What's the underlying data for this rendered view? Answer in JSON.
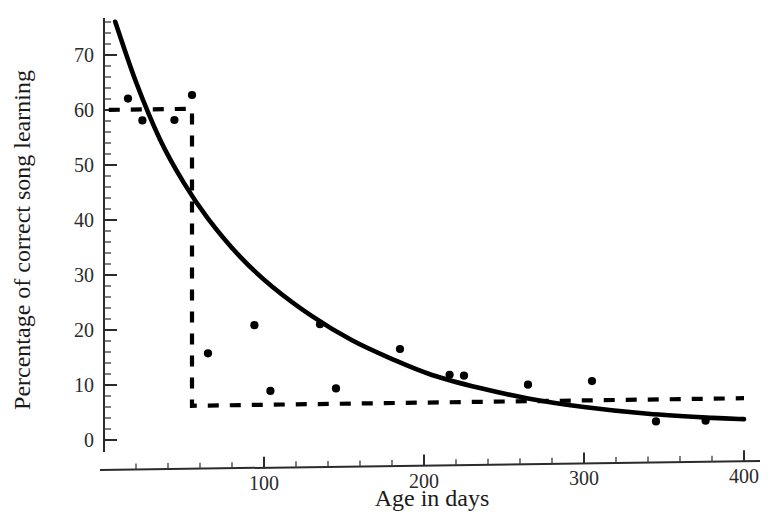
{
  "chart_data": {
    "type": "scatter",
    "title": "",
    "subtitle": "",
    "xlabel": "Age in days",
    "ylabel": "Percentage of correct song learning",
    "xlim": [
      0,
      405
    ],
    "ylim": [
      0,
      77
    ],
    "grid": false,
    "legend": "none",
    "x_ticks": [
      100,
      200,
      300,
      400
    ],
    "x_tick_labels": [
      "100",
      "200",
      "300",
      "400"
    ],
    "x_minor_tick_step": 20,
    "y_ticks": [
      0,
      10,
      20,
      30,
      40,
      50,
      60,
      70
    ],
    "y_tick_labels": [
      "0",
      "10",
      "20",
      "30",
      "40",
      "50",
      "60",
      "70"
    ],
    "y_minor_tick_step": 2,
    "series": [
      {
        "name": "Observed song learning",
        "type": "scatter",
        "marker": "filled-circle",
        "color": "#000000",
        "points": [
          {
            "x": 15,
            "y": 62.0
          },
          {
            "x": 24,
            "y": 58.0
          },
          {
            "x": 44,
            "y": 58.0
          },
          {
            "x": 55,
            "y": 62.5
          },
          {
            "x": 65,
            "y": 15.5
          },
          {
            "x": 94,
            "y": 20.5
          },
          {
            "x": 104,
            "y": 8.5
          },
          {
            "x": 135,
            "y": 20.5
          },
          {
            "x": 145,
            "y": 8.8
          },
          {
            "x": 185,
            "y": 15.8
          },
          {
            "x": 216,
            "y": 11.0
          },
          {
            "x": 225,
            "y": 10.8
          },
          {
            "x": 265,
            "y": 9.0
          },
          {
            "x": 305,
            "y": 9.5
          },
          {
            "x": 345,
            "y": 2.0
          },
          {
            "x": 376,
            "y": 2.0
          }
        ]
      },
      {
        "name": "Exponential decay fit",
        "type": "line",
        "style": "solid",
        "color": "#000000",
        "points": [
          {
            "x": 7,
            "y": 76.0
          },
          {
            "x": 20,
            "y": 65.0
          },
          {
            "x": 35,
            "y": 54.5
          },
          {
            "x": 50,
            "y": 46.5
          },
          {
            "x": 65,
            "y": 40.0
          },
          {
            "x": 85,
            "y": 33.0
          },
          {
            "x": 105,
            "y": 27.5
          },
          {
            "x": 130,
            "y": 22.0
          },
          {
            "x": 155,
            "y": 17.5
          },
          {
            "x": 180,
            "y": 14.0
          },
          {
            "x": 205,
            "y": 11.0
          },
          {
            "x": 235,
            "y": 8.5
          },
          {
            "x": 265,
            "y": 6.5
          },
          {
            "x": 300,
            "y": 4.8
          },
          {
            "x": 340,
            "y": 3.4
          },
          {
            "x": 380,
            "y": 2.5
          },
          {
            "x": 400,
            "y": 2.2
          }
        ]
      },
      {
        "name": "Sensitive-period step function",
        "type": "step",
        "style": "dashed",
        "color": "#000000",
        "points": [
          {
            "x": 3,
            "y": 60.0
          },
          {
            "x": 55,
            "y": 60.0
          },
          {
            "x": 55,
            "y": 6.0
          },
          {
            "x": 400,
            "y": 6.0
          }
        ]
      }
    ],
    "annotations": []
  }
}
